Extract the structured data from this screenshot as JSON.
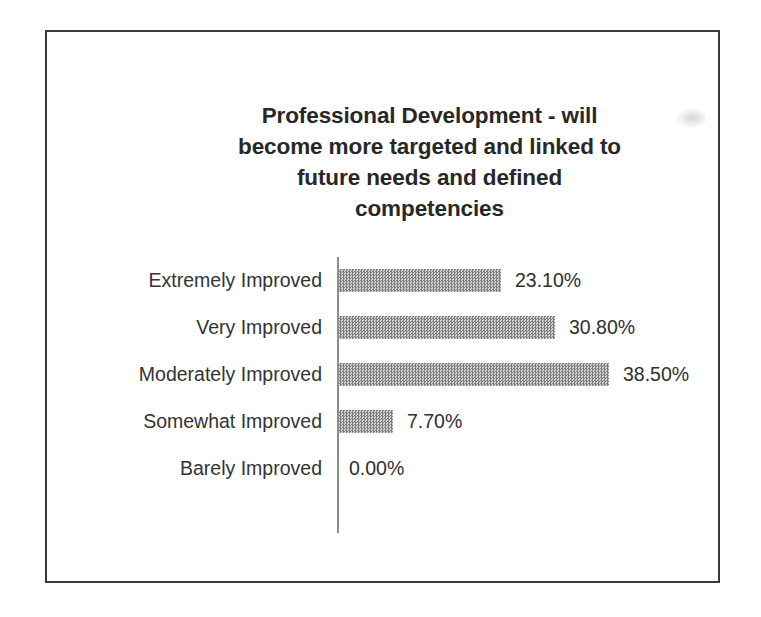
{
  "page": {
    "background_color": "#ffffff",
    "frame_color": "#3a3a3c"
  },
  "chart_data": {
    "type": "bar",
    "orientation": "horizontal",
    "title": "Professional Development - will become more targeted and linked to future needs and defined competencies",
    "title_lines": [
      "Professional Development - will",
      "become more targeted and linked to",
      "future needs and defined",
      "competencies"
    ],
    "categories": [
      "Extremely Improved",
      "Very Improved",
      "Moderately Improved",
      "Somewhat Improved",
      "Barely Improved"
    ],
    "values": [
      23.1,
      30.8,
      38.5,
      7.7,
      0.0
    ],
    "value_labels": [
      "23.10%",
      "30.80%",
      "38.50%",
      "7.70%",
      "0.00%"
    ],
    "xlabel": "",
    "ylabel": "",
    "xlim": [
      0,
      38.5
    ],
    "grid": false,
    "legend": false,
    "series": [
      {
        "name": "Percent of responses",
        "values": [
          23.1,
          30.8,
          38.5,
          7.7,
          0.0
        ]
      }
    ],
    "bar_color": "#a2a2a4",
    "axis_color": "#8d8d90",
    "text_color": "#333335",
    "px_per_percent": 7.01
  }
}
